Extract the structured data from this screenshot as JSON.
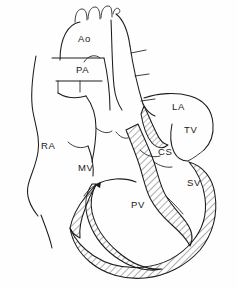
{
  "figure": {
    "background_color": "#fefefe",
    "line_color": "#1c1c1c",
    "hatch_color": "#4a4a4a",
    "width": 237,
    "height": 289
  },
  "labels": [
    {
      "id": "ao",
      "text": "Ao",
      "name": "aorta",
      "x": 78,
      "y": 42
    },
    {
      "id": "pa",
      "text": "PA",
      "name": "pulmonary-artery",
      "x": 76,
      "y": 73
    },
    {
      "id": "la",
      "text": "LA",
      "name": "left-atrium",
      "x": 172,
      "y": 110
    },
    {
      "id": "tv",
      "text": "TV",
      "name": "tricuspid-valve",
      "x": 184,
      "y": 133
    },
    {
      "id": "cs",
      "text": "CS",
      "name": "coronary-sinus",
      "x": 158,
      "y": 155
    },
    {
      "id": "ra",
      "text": "RA",
      "name": "right-atrium",
      "x": 41,
      "y": 149
    },
    {
      "id": "mv",
      "text": "MV",
      "name": "mitral-valve",
      "x": 78,
      "y": 171
    },
    {
      "id": "sv",
      "text": "SV",
      "name": "systemic-ventricle",
      "x": 187,
      "y": 186
    },
    {
      "id": "pv",
      "text": "PV",
      "name": "pulmonary-ventricle",
      "x": 131,
      "y": 208
    }
  ],
  "legend_keys": {
    "hatched_region": "myocardium",
    "open_region": "chamber-lumen"
  }
}
